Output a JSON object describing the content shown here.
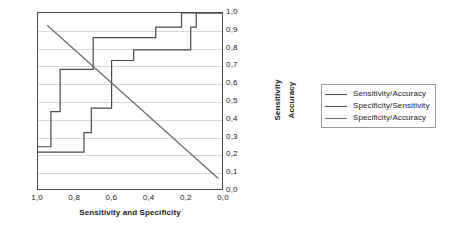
{
  "chart_data": {
    "type": "line",
    "title": "",
    "xlabel": "Sensitivity and Specificity",
    "ylabel": "Sensitivity Accuracy",
    "ylabel_words": [
      "Sensitivity",
      "Accuracy"
    ],
    "xlim": [
      1.0,
      0.0
    ],
    "ylim": [
      0.0,
      1.0
    ],
    "x_reversed": true,
    "grid": true,
    "legend_position": "right",
    "xticks": [
      "1,0",
      "0,8",
      "0,6",
      "0,4",
      "0,2",
      "0,0"
    ],
    "xtick_values": [
      1.0,
      0.8,
      0.6,
      0.4,
      0.2,
      0.0
    ],
    "yticks": [
      "0,0",
      "0,1",
      "0,2",
      "0,3",
      "0,4",
      "0,5",
      "0,6",
      "0,7",
      "0,8",
      "0,9",
      "1,0"
    ],
    "ytick_values": [
      0.0,
      0.1,
      0.2,
      0.3,
      0.4,
      0.5,
      0.6,
      0.7,
      0.8,
      0.9,
      1.0
    ],
    "series": [
      {
        "name": "Sensitivity/Accuracy",
        "style": "step",
        "color": "#4a4a4a",
        "points": [
          [
            1.0,
            0.24
          ],
          [
            0.93,
            0.24
          ],
          [
            0.93,
            0.44
          ],
          [
            0.88,
            0.44
          ],
          [
            0.88,
            0.68
          ],
          [
            0.7,
            0.68
          ],
          [
            0.7,
            0.86
          ],
          [
            0.36,
            0.86
          ],
          [
            0.36,
            0.92
          ],
          [
            0.22,
            0.92
          ],
          [
            0.22,
            1.0
          ],
          [
            0.0,
            1.0
          ]
        ]
      },
      {
        "name": "Specificity/Sensitivity",
        "style": "step",
        "color": "#4a4a4a",
        "points": [
          [
            1.0,
            0.21
          ],
          [
            0.75,
            0.21
          ],
          [
            0.75,
            0.32
          ],
          [
            0.71,
            0.32
          ],
          [
            0.71,
            0.46
          ],
          [
            0.6,
            0.46
          ],
          [
            0.6,
            0.73
          ],
          [
            0.48,
            0.73
          ],
          [
            0.48,
            0.79
          ],
          [
            0.17,
            0.79
          ],
          [
            0.17,
            0.92
          ],
          [
            0.14,
            0.92
          ],
          [
            0.14,
            1.0
          ],
          [
            0.0,
            1.0
          ]
        ]
      },
      {
        "name": "Specificity/Accuracy",
        "style": "line",
        "color": "#6a6a6a",
        "points": [
          [
            0.95,
            0.93
          ],
          [
            0.02,
            0.06
          ]
        ]
      }
    ]
  },
  "legend": {
    "entries": [
      {
        "label": "Sensitivity/Accuracy"
      },
      {
        "label": "Specificity/Sensitivity"
      },
      {
        "label": "Specificity/Accuracy"
      }
    ]
  }
}
